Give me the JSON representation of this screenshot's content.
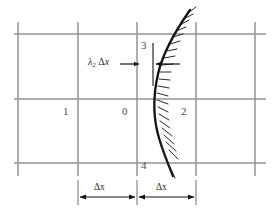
{
  "figure": {
    "background": "#ffffff",
    "grid_color": "#8f8f8f",
    "curve_color": "#111111",
    "annotation_color": "#2b2b2b",
    "node_labels": [
      {
        "id": "node-0",
        "text": "0",
        "x": 122,
        "y": 112
      },
      {
        "id": "node-1",
        "text": "1",
        "x": 63,
        "y": 112
      },
      {
        "id": "node-2",
        "text": "2",
        "x": 181,
        "y": 112
      },
      {
        "id": "node-3",
        "text": "3",
        "x": 141,
        "y": 46
      },
      {
        "id": "node-4",
        "text": "4",
        "x": 141,
        "y": 165
      }
    ],
    "annotations": {
      "lambda_label": {
        "symbol": "λ",
        "subscript": "2",
        "delta": "Δ",
        "variable": "x",
        "full_text": "λ₂ Δx",
        "x": 96,
        "y": 62
      },
      "dimension_left": {
        "text": "Δx",
        "x": 94,
        "y": 189
      },
      "dimension_right": {
        "text": "Δx",
        "x": 166,
        "y": 189
      }
    },
    "grid": {
      "vertical_lines_x": [
        18,
        78,
        137,
        196,
        255
      ],
      "horizontal_lines_y": [
        34,
        99,
        163
      ],
      "x_min": 14,
      "x_max": 266,
      "y_min": 8,
      "y_max": 180
    },
    "boundary_curve": {
      "description": "hatched curved boundary",
      "hatch_side": "right",
      "hatch_count": 18
    },
    "footer_text": ""
  }
}
